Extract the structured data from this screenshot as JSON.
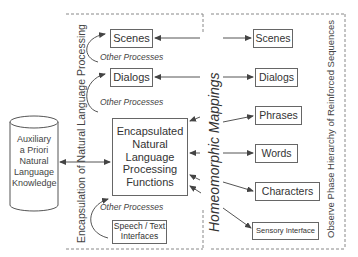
{
  "diagram": {
    "left_panel": {
      "vertical_label": "Encapsulation of Natural Language Processing",
      "boxes": {
        "scenes": "Scenes",
        "dialogs": "Dialogs",
        "core_lines": [
          "Encapsulated",
          "Natural",
          "Language",
          "Processing",
          "Functions"
        ],
        "speech_lines": [
          "Speech / Text",
          "Interfaces"
        ]
      },
      "other_processes": [
        "Other Processes",
        "Other Processes",
        "Other Processes"
      ]
    },
    "knowledge_store": {
      "lines": [
        "Auxiliary",
        "a Priori",
        "Natural",
        "Language",
        "Knowledge"
      ]
    },
    "middle_label": "Homeomorphic Mappings",
    "right_panel": {
      "vertical_label": "Observe Phase Hierarchy of Reinforced Sequences",
      "boxes": [
        "Scenes",
        "Dialogs",
        "Phrases",
        "Words",
        "Characters",
        "Sensory Interface"
      ]
    },
    "colors": {
      "line": "#555555",
      "dashed": "#888888",
      "text": "#333333"
    }
  }
}
